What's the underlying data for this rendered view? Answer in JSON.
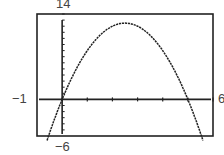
{
  "chart_data": {
    "type": "line",
    "title": "",
    "xlabel": "",
    "ylabel": "",
    "xlim": [
      -1,
      6
    ],
    "ylim": [
      -6,
      14
    ],
    "window_labels": {
      "xmin": "−1",
      "xmax": "6",
      "ymin": "−6",
      "ymax": "14"
    },
    "grid": false,
    "x_ticks": [
      0,
      1,
      2,
      3,
      4,
      5,
      6
    ],
    "y_ticks": [
      -5,
      -4,
      -3,
      -2,
      -1,
      0,
      1,
      2,
      3,
      4,
      5,
      6,
      7,
      8,
      9,
      10,
      11,
      12,
      13,
      14
    ],
    "series": [
      {
        "name": "y = -2x^2 + 10x",
        "style": "dotted-pixel",
        "color": "#222222",
        "x": [
          -0.6,
          -0.5,
          0,
          0.5,
          1,
          1.5,
          2,
          2.5,
          3,
          3.5,
          4,
          4.5,
          5,
          5.5,
          5.6
        ],
        "y": [
          -6.72,
          -5.5,
          0,
          4.5,
          8,
          10.5,
          12,
          12.5,
          12,
          10.5,
          8,
          4.5,
          0,
          -5.5,
          -6.72
        ]
      }
    ]
  },
  "colors": {
    "frame": "#222222",
    "axis": "#222222",
    "curve": "#222222",
    "background": "#ffffff"
  }
}
